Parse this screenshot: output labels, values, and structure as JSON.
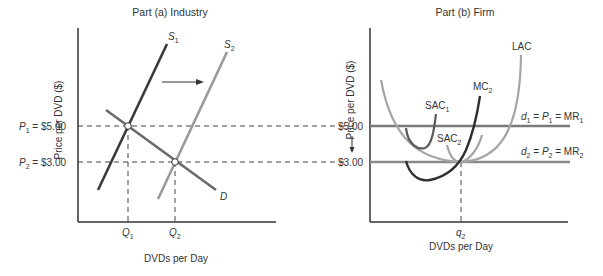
{
  "panel_a": {
    "title": "Part (a) Industry",
    "ylabel": "Price per DVD ($)",
    "xlabel": "DVDs per Day",
    "price_labels": {
      "p1": {
        "sym": "P",
        "sub": "1",
        "rest": " = $5.00"
      },
      "p2": {
        "sym": "P",
        "sub": "2",
        "rest": " = $3.00"
      }
    },
    "q_labels": {
      "q1": {
        "sym": "Q",
        "sub": "1"
      },
      "q2": {
        "sym": "Q",
        "sub": "2"
      }
    },
    "curves": {
      "s1": {
        "sym": "S",
        "sub": "1"
      },
      "s2": {
        "sym": "S",
        "sub": "2"
      },
      "d": {
        "sym": "D"
      }
    }
  },
  "panel_b": {
    "title": "Part (b) Firm",
    "ylabel": "Price per DVD ($)",
    "xlabel": "DVDs per Day",
    "price_labels": {
      "p1": "$5.00",
      "p2": "$3.00"
    },
    "q_label": {
      "sym": "q",
      "sub": "2"
    },
    "curves": {
      "lac": "LAC",
      "mc2": {
        "base": "MC",
        "sub": "2"
      },
      "sac1": {
        "base": "SAC",
        "sub": "1"
      },
      "sac2": {
        "base": "SAC",
        "sub": "2"
      },
      "d1": {
        "d": "d",
        "dsub": "1",
        "eq": " = ",
        "p": "P",
        "psub": "1",
        "eq2": " = MR",
        "mrsub": "1"
      },
      "d2": {
        "d": "d",
        "dsub": "2",
        "eq": " = ",
        "p": "P",
        "psub": "2",
        "eq2": " = MR",
        "mrsub": "2"
      }
    }
  },
  "colors": {
    "dark": "#3a3a3a",
    "gray": "#9a9a9a",
    "axis": "#333333"
  }
}
